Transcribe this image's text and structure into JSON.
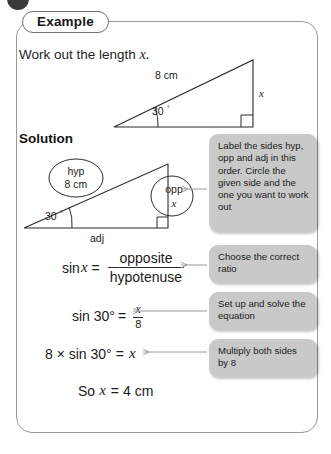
{
  "page": {
    "bullet_icon": "filled-circle-bullet"
  },
  "card": {
    "tab_label": "Example",
    "prompt_text": "Work out the length",
    "prompt_var": "x.",
    "solution_heading": "Solution"
  },
  "diagram_1": {
    "name": "right-triangle-question",
    "hypotenuse_label": "8 cm",
    "angle_label": "30°",
    "opposite_label": "x",
    "right_angle_marker": "square-marker"
  },
  "diagram_2": {
    "name": "right-triangle-solution",
    "hyp_circle_line1": "hyp",
    "hyp_circle_line2": "8 cm",
    "opp_circle_line1": "opp",
    "opp_circle_line2": "x",
    "angle_label": "30°",
    "adjacent_label": "adj",
    "right_angle_marker": "square-marker"
  },
  "equations": {
    "ratio": {
      "lhs_sin": "sin",
      "lhs_var": "x",
      "equals": "=",
      "numerator": "opposite",
      "denominator": "hypotenuse"
    },
    "substituted": {
      "lhs": "sin 30°",
      "equals": "=",
      "numerator": "x",
      "denominator": "8"
    },
    "multiplied": {
      "lhs": "8 × sin 30°",
      "equals": "=",
      "rhs_var": "x"
    },
    "answer": {
      "prefix": "So",
      "var": "x",
      "equals": "=",
      "value": "4 cm"
    }
  },
  "callouts": [
    {
      "id": "label-sides",
      "text": "Label the sides hyp, opp and adj in this order. Circle the given side and the one you want to work out"
    },
    {
      "id": "choose-ratio",
      "text": "Choose the correct ratio"
    },
    {
      "id": "set-up-solve",
      "text": "Set up and solve the equation"
    },
    {
      "id": "multiply-both",
      "text": "Multiply both sides by 8"
    }
  ],
  "colors": {
    "callout_bg": "#c9c9c9",
    "card_border": "#9a9a9a",
    "ink": "#1c1c1c",
    "bullet": "#3a3a3c"
  }
}
